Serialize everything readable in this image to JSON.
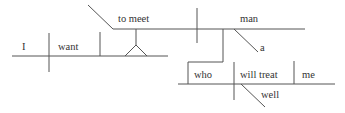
{
  "diagram": {
    "type": "sentence-diagram",
    "sentence_words": {
      "subject": "I",
      "verb": "want",
      "infinitive": "to meet",
      "object": "man",
      "article": "a",
      "rel_pronoun": "who",
      "rel_verb": "will treat",
      "rel_object": "me",
      "adverb": "well"
    },
    "colors": {
      "line": "#555555",
      "text": "#333333",
      "background": "#ffffff"
    }
  }
}
